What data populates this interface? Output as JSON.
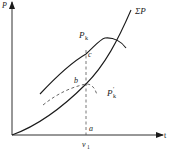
{
  "diagram": {
    "type": "power-balance-curves",
    "colors": {
      "line": "#1a1a1a",
      "dashed": "#555555",
      "background": "#ffffff"
    },
    "axes": {
      "x_label": "t",
      "y_label": "P",
      "x_tick_label": "v",
      "x_tick_sub": "1"
    },
    "curves": [
      {
        "id": "sum-p",
        "label": "ΣP",
        "style": "solid"
      },
      {
        "id": "p-k",
        "label": "P",
        "sub": "k",
        "style": "solid"
      },
      {
        "id": "p-k-prime",
        "label": "P",
        "sub": "k",
        "sup": "′",
        "style": "dashed"
      }
    ],
    "points": {
      "a": "a",
      "b": "b",
      "c": "c"
    }
  }
}
